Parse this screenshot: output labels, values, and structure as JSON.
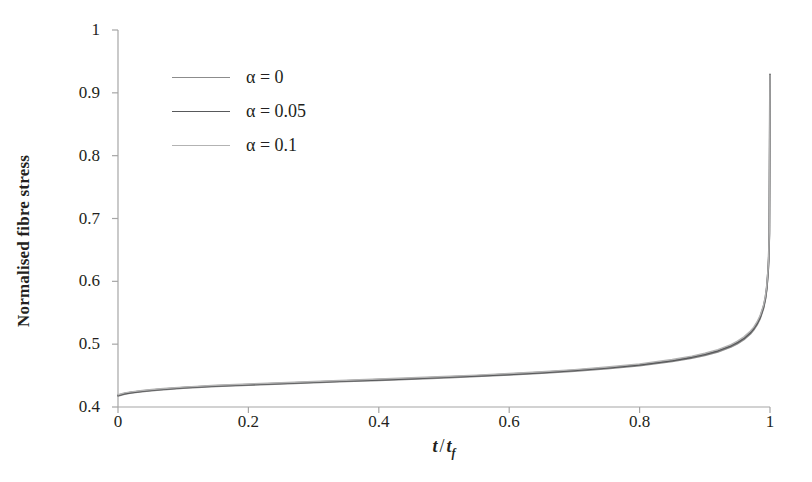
{
  "chart_data": {
    "type": "line",
    "title": "",
    "xlabel": "t / tf",
    "ylabel": "Normalised fibre stress",
    "xlim": [
      0,
      1
    ],
    "ylim": [
      0.4,
      1
    ],
    "grid": false,
    "legend_position": "upper-left",
    "xticks": [
      "0",
      "0.2",
      "0.4",
      "0.6",
      "0.8",
      "1"
    ],
    "xtick_values": [
      0,
      0.2,
      0.4,
      0.6,
      0.8,
      1
    ],
    "yticks": [
      "0.4",
      "0.5",
      "0.6",
      "0.7",
      "0.8",
      "0.9",
      "1"
    ],
    "ytick_values": [
      0.4,
      0.5,
      0.6,
      0.7,
      0.8,
      0.9,
      1
    ],
    "x": [
      0,
      0.01,
      0.02,
      0.04,
      0.06,
      0.08,
      0.1,
      0.15,
      0.2,
      0.25,
      0.3,
      0.35,
      0.4,
      0.45,
      0.5,
      0.55,
      0.6,
      0.65,
      0.7,
      0.75,
      0.8,
      0.85,
      0.88,
      0.9,
      0.92,
      0.94,
      0.95,
      0.96,
      0.97,
      0.975,
      0.98,
      0.985,
      0.99,
      0.993,
      0.995,
      0.997,
      0.998,
      0.999,
      1
    ],
    "series": [
      {
        "name": "alpha = 0",
        "color": "#8c8c8c",
        "width": 1.6,
        "values": [
          0.4175,
          0.4205,
          0.4222,
          0.4248,
          0.4268,
          0.4284,
          0.4298,
          0.4326,
          0.4348,
          0.4368,
          0.4387,
          0.4405,
          0.4424,
          0.4443,
          0.4463,
          0.4485,
          0.4509,
          0.4537,
          0.4569,
          0.4608,
          0.4657,
          0.4723,
          0.4775,
          0.4819,
          0.4876,
          0.4954,
          0.5006,
          0.5072,
          0.5163,
          0.5224,
          0.5303,
          0.5408,
          0.5562,
          0.5712,
          0.5868,
          0.6122,
          0.6331,
          0.6742,
          0.9295
        ]
      },
      {
        "name": "alpha = 0.05",
        "color": "#58595b",
        "width": 1.8,
        "values": [
          0.4185,
          0.4214,
          0.4231,
          0.4257,
          0.4277,
          0.4293,
          0.4307,
          0.4335,
          0.4357,
          0.4377,
          0.4396,
          0.4415,
          0.4434,
          0.4453,
          0.4474,
          0.4496,
          0.4521,
          0.4549,
          0.4582,
          0.4622,
          0.4672,
          0.4739,
          0.4792,
          0.4837,
          0.4895,
          0.4974,
          0.5027,
          0.5094,
          0.5186,
          0.5248,
          0.5328,
          0.5434,
          0.559,
          0.5741,
          0.5899,
          0.6155,
          0.6366,
          0.6779,
          0.929
        ]
      },
      {
        "name": "alpha = 0.1",
        "color": "#b3b3b3",
        "width": 1.4,
        "values": [
          0.4195,
          0.4224,
          0.4241,
          0.4267,
          0.4287,
          0.4303,
          0.4317,
          0.4345,
          0.4367,
          0.4387,
          0.4407,
          0.4426,
          0.4445,
          0.4465,
          0.4486,
          0.4508,
          0.4533,
          0.4562,
          0.4595,
          0.4636,
          0.4687,
          0.4755,
          0.4809,
          0.4855,
          0.4914,
          0.4994,
          0.5048,
          0.5116,
          0.521,
          0.5272,
          0.5353,
          0.546,
          0.5618,
          0.577,
          0.593,
          0.6188,
          0.6401,
          0.6816,
          0.9285
        ]
      }
    ]
  },
  "axes": {
    "axis_color": "#a6a6a6",
    "tick_color": "#a6a6a6",
    "text_color": "#231f20",
    "background": "#ffffff"
  },
  "xaxis_title": {
    "variable": "t",
    "separator": "/",
    "denominator": "t",
    "denominator_subscript": "f"
  },
  "yaxis_title": {
    "text": "Normalised fibre stress"
  },
  "legend": {
    "entries": [
      {
        "label": "α = 0",
        "symbol": "α",
        "equals": "=",
        "value": "0",
        "color": "#8c8c8c"
      },
      {
        "label": "α = 0.05",
        "symbol": "α",
        "equals": "=",
        "value": "0.05",
        "color": "#58595b"
      },
      {
        "label": "α = 0.1",
        "symbol": "α",
        "equals": "=",
        "value": "0.1",
        "color": "#b3b3b3"
      }
    ]
  }
}
